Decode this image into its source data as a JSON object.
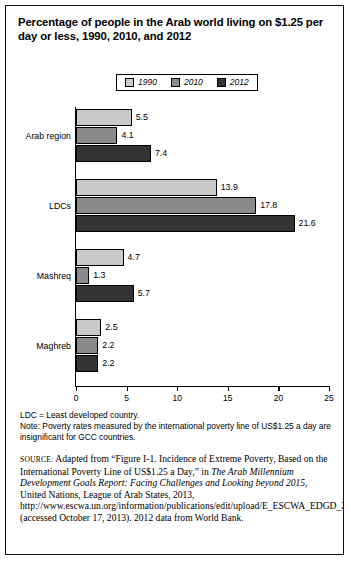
{
  "figure": {
    "title": "Percentage of people in the Arab world living on $1.25 per day or less, 1990, 2010, and 2012"
  },
  "legend": {
    "items": [
      {
        "label": "1990",
        "color": "#c9c9c9"
      },
      {
        "label": "2010",
        "color": "#8b8b8b"
      },
      {
        "label": "2012",
        "color": "#333333"
      }
    ]
  },
  "notes": {
    "line1": "LDC = Least developed country.",
    "line2": "Note: Poverty rates measured by the international poverty line of US$1.25 a day are insignificant for GCC countries."
  },
  "source": {
    "label": "SOURCE:",
    "part1": " Adapted from “Figure I-1. Incidence of Extreme Poverty, Based on the International Poverty Line of US$1.25 a Day,” in ",
    "italic1": "The Arab Millennium Development Goals Report: Facing Challenges and Looking beyond 2015",
    "part2": ", United Nations, League of Arab States, 2013, http://www.escwa.un.org/information/publications/edit/upload/E_ESCWA_EDGD_2013_1_E.pdf (accessed October 17, 2013). 2012 data from World Bank."
  },
  "chart_data": {
    "type": "bar",
    "orientation": "horizontal",
    "title": "Percentage of people in the Arab world living on $1.25 per day or less, 1990, 2010, and 2012",
    "xlabel": "",
    "ylabel": "",
    "xlim": [
      0,
      25
    ],
    "xticks": [
      0,
      5,
      10,
      15,
      20,
      25
    ],
    "grid": false,
    "legend_position": "top-center",
    "categories": [
      "Arab region",
      "LDCs",
      "Mashreq",
      "Maghreb"
    ],
    "series": [
      {
        "name": "1990",
        "color": "#c9c9c9",
        "values": [
          5.5,
          13.9,
          4.7,
          2.5
        ]
      },
      {
        "name": "2010",
        "color": "#8b8b8b",
        "values": [
          4.1,
          17.8,
          1.3,
          2.2
        ]
      },
      {
        "name": "2012",
        "color": "#333333",
        "values": [
          7.4,
          21.6,
          5.7,
          2.2
        ]
      }
    ]
  }
}
